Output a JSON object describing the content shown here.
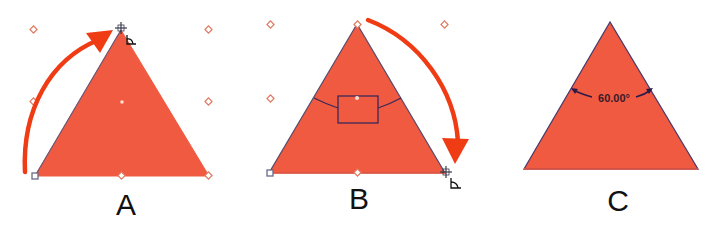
{
  "colors": {
    "fill": "#f05a40",
    "outline": "#4a3a6a",
    "arrow": "#f03c14",
    "handle": "#e07a60",
    "text": "#111111"
  },
  "panels": [
    {
      "label": "A",
      "description": "Triangle selected with corner handle dragged from bottom-left vertex up to top",
      "vertices": [
        [
          121,
          30
        ],
        [
          35,
          176
        ],
        [
          209,
          176
        ]
      ],
      "arrow_direction": "clockwise-up"
    },
    {
      "label": "B",
      "description": "Triangle with angle widget; drag from top vertex to bottom-right",
      "vertices": [
        [
          357,
          24
        ],
        [
          269,
          173
        ],
        [
          445,
          173
        ]
      ],
      "arrow_direction": "clockwise-down"
    },
    {
      "label": "C",
      "description": "Resulting equilateral triangle showing apex angle",
      "vertices": [
        [
          610,
          22
        ],
        [
          524,
          169
        ],
        [
          698,
          169
        ]
      ],
      "angle_label": "60.00°"
    }
  ]
}
